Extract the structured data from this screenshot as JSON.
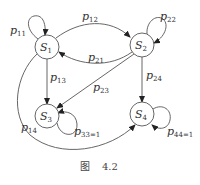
{
  "diagram": {
    "type": "state-transition-graph",
    "nodes": [
      {
        "id": "S1",
        "label": "S",
        "sub": "1"
      },
      {
        "id": "S2",
        "label": "S",
        "sub": "2"
      },
      {
        "id": "S3",
        "label": "S",
        "sub": "3"
      },
      {
        "id": "S4",
        "label": "S",
        "sub": "4"
      }
    ],
    "edges": [
      {
        "from": "S1",
        "to": "S1",
        "label": "p",
        "sub": "11"
      },
      {
        "from": "S2",
        "to": "S2",
        "label": "p",
        "sub": "22"
      },
      {
        "from": "S1",
        "to": "S2",
        "label": "p",
        "sub": "12"
      },
      {
        "from": "S2",
        "to": "S1",
        "label": "p",
        "sub": "21"
      },
      {
        "from": "S1",
        "to": "S3",
        "label": "p",
        "sub": "13"
      },
      {
        "from": "S2",
        "to": "S3",
        "label": "p",
        "sub": "23"
      },
      {
        "from": "S2",
        "to": "S4",
        "label": "p",
        "sub": "24"
      },
      {
        "from": "S1",
        "to": "S4",
        "label": "p",
        "sub": "14"
      },
      {
        "from": "S3",
        "to": "S3",
        "label": "p",
        "sub": "33=1"
      },
      {
        "from": "S4",
        "to": "S4",
        "label": "p",
        "sub": "44=1"
      }
    ],
    "caption": {
      "prefix": "图",
      "number": "4.2"
    }
  }
}
